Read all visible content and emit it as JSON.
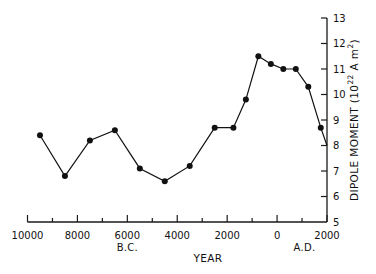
{
  "chart_data": {
    "type": "line",
    "title": "",
    "xlabel": "YEAR",
    "ylabel": "DIPOLE MOMENT (10^22 A m^2)",
    "ylabel_parts": {
      "main": "DIPOLE MOMENT (10",
      "sup1": "22",
      "mid": " A m",
      "sup2": "2",
      "end": ")"
    },
    "xlim": [
      -10000,
      2000
    ],
    "ylim": [
      5,
      13
    ],
    "x_ticks": [
      -10000,
      -9000,
      -8000,
      -7000,
      -6000,
      -5000,
      -4000,
      -3000,
      -2000,
      -1000,
      0,
      1000,
      2000
    ],
    "x_tick_labels": [
      {
        "value": -10000,
        "label": "10000"
      },
      {
        "value": -8000,
        "label": "8000"
      },
      {
        "value": -6000,
        "label": "6000"
      },
      {
        "value": -4000,
        "label": "4000"
      },
      {
        "value": -2000,
        "label": "2000"
      },
      {
        "value": 0,
        "label": "0"
      },
      {
        "value": 2000,
        "label": "2000"
      }
    ],
    "y_ticks": [
      5,
      6,
      7,
      8,
      9,
      10,
      11,
      12,
      13
    ],
    "y_axis_position": "right",
    "era_labels": [
      {
        "label": "B.C.",
        "x": -6000
      },
      {
        "label": "A.D.",
        "x": 1100
      }
    ],
    "grid": false,
    "legend": null,
    "series": [
      {
        "name": "Dipole moment",
        "x": [
          -9500,
          -8500,
          -7500,
          -6500,
          -5500,
          -4500,
          -3500,
          -2500,
          -1750,
          -1250,
          -750,
          -250,
          250,
          750,
          1250,
          1750
        ],
        "values": [
          8.4,
          6.8,
          8.2,
          8.6,
          7.1,
          6.6,
          7.2,
          8.7,
          8.7,
          9.8,
          11.5,
          11.2,
          11.0,
          11.0,
          10.3,
          8.7
        ],
        "end_point": {
          "x": 2000,
          "value": 8.0,
          "marker": false
        },
        "marker": "filled-circle",
        "color": "#111111"
      }
    ]
  }
}
